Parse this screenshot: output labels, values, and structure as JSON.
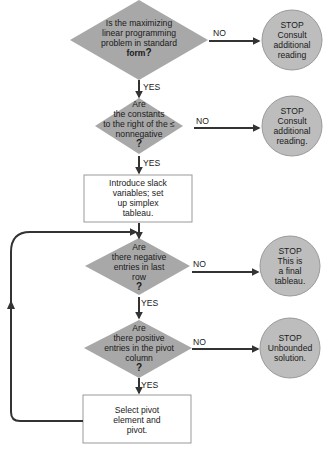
{
  "diagram": {
    "type": "flowchart",
    "colors": {
      "decision_fill": "#a8a8a8",
      "stop_fill": "#bdbdbd",
      "box_fill": "#ffffff",
      "line": "#333333"
    },
    "nodes": [
      {
        "id": "d1",
        "shape": "diamond",
        "lines": [
          "Is the maximizing",
          "linear programming",
          "problem in standard",
          "form"
        ],
        "mark": "?"
      },
      {
        "id": "s1",
        "shape": "circle",
        "lines": [
          "STOP",
          "Consult",
          "additional",
          "reading"
        ]
      },
      {
        "id": "d2",
        "shape": "diamond",
        "lines": [
          "Are",
          "the constants",
          "to the right of the ≤",
          "nonnegative"
        ],
        "mark": "?"
      },
      {
        "id": "s2",
        "shape": "circle",
        "lines": [
          "STOP",
          "Consult",
          "additional",
          "reading."
        ]
      },
      {
        "id": "b1",
        "shape": "box",
        "lines": [
          "Introduce slack",
          "variables; set",
          "up simplex",
          "tableau."
        ]
      },
      {
        "id": "d3",
        "shape": "diamond",
        "lines": [
          "Are",
          "there negative",
          "entries in last",
          "row"
        ],
        "mark": "?"
      },
      {
        "id": "s3",
        "shape": "circle",
        "lines": [
          "STOP",
          "This is",
          "a final",
          "tableau."
        ]
      },
      {
        "id": "d4",
        "shape": "diamond",
        "lines": [
          "Are",
          "there positive",
          "entries in the pivot",
          "column"
        ],
        "mark": "?"
      },
      {
        "id": "s4",
        "shape": "circle",
        "lines": [
          "STOP",
          "Unbounded",
          "solution."
        ]
      },
      {
        "id": "b2",
        "shape": "box",
        "lines": [
          "Select pivot",
          "element and",
          "pivot."
        ]
      }
    ],
    "edges": [
      {
        "from": "d1",
        "to": "s1",
        "label": "NO"
      },
      {
        "from": "d1",
        "to": "d2",
        "label": "YES"
      },
      {
        "from": "d2",
        "to": "s2",
        "label": "NO"
      },
      {
        "from": "d2",
        "to": "b1",
        "label": "YES"
      },
      {
        "from": "b1",
        "to": "d3",
        "label": ""
      },
      {
        "from": "d3",
        "to": "s3",
        "label": "NO"
      },
      {
        "from": "d3",
        "to": "d4",
        "label": "YES"
      },
      {
        "from": "d4",
        "to": "s4",
        "label": "NO"
      },
      {
        "from": "d4",
        "to": "b2",
        "label": "YES"
      },
      {
        "from": "b2",
        "to": "d3",
        "label": ""
      }
    ]
  }
}
